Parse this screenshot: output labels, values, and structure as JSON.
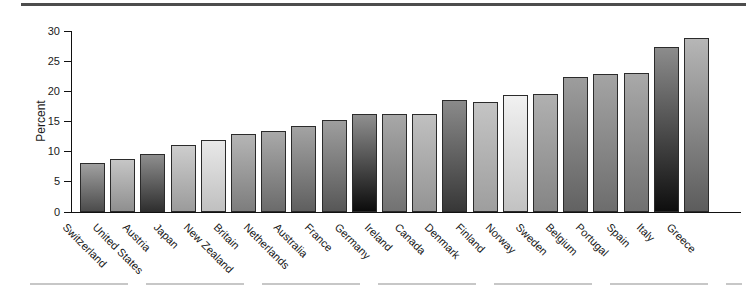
{
  "figure": {
    "ylabel": "Percent",
    "top_rule_color": "#4d4d4d",
    "bottom_rule_color": "#c7c7c7",
    "axis_color": "#111111",
    "bar_border_color": "#2b2b2b",
    "background": "#ffffff"
  },
  "chart_data": {
    "type": "bar",
    "title": "",
    "xlabel": "",
    "ylabel": "Percent",
    "ylim": [
      0,
      30
    ],
    "yticks": [
      0,
      5,
      10,
      15,
      20,
      25,
      30
    ],
    "grid": false,
    "legend": "none",
    "categories": [
      "Switzerland",
      "United States",
      "Austria",
      "Japan",
      "New Zealand",
      "Britain",
      "Netherlands",
      "Australia",
      "France",
      "Germany",
      "Ireland",
      "Canada",
      "Denmark",
      "Finland",
      "Norway",
      "Sweden",
      "Belgium",
      "Portugal",
      "Spain",
      "Italy",
      "Greece"
    ],
    "values": [
      8.2,
      8.8,
      9.6,
      11.1,
      11.9,
      13.0,
      13.4,
      14.2,
      15.2,
      16.2,
      16.2,
      16.3,
      18.5,
      18.3,
      19.4,
      19.5,
      22.4,
      22.9,
      23.1,
      27.3,
      28.9
    ],
    "bar_gradients": [
      {
        "top": "#a0a0a0",
        "bottom": "#4c4c4c"
      },
      {
        "top": "#c6c6c6",
        "bottom": "#8f8f8f"
      },
      {
        "top": "#8e8e8e",
        "bottom": "#2f2f2f"
      },
      {
        "top": "#cdcdcd",
        "bottom": "#9b9b9b"
      },
      {
        "top": "#e8e8e8",
        "bottom": "#c0c0c0"
      },
      {
        "top": "#b5b5b5",
        "bottom": "#7d7d7d"
      },
      {
        "top": "#a9a9a9",
        "bottom": "#6b6b6b"
      },
      {
        "top": "#a3a3a3",
        "bottom": "#5f5f5f"
      },
      {
        "top": "#9e9e9e",
        "bottom": "#575757"
      },
      {
        "top": "#8f8f8f",
        "bottom": "#0c0c0c"
      },
      {
        "top": "#a8a8a8",
        "bottom": "#727272"
      },
      {
        "top": "#c0c0c0",
        "bottom": "#949494"
      },
      {
        "top": "#8a8a8a",
        "bottom": "#373737"
      },
      {
        "top": "#c4c4c4",
        "bottom": "#9e9e9e"
      },
      {
        "top": "#f1f1f1",
        "bottom": "#c2c2c2"
      },
      {
        "top": "#b0b0b0",
        "bottom": "#858585"
      },
      {
        "top": "#9d9d9d",
        "bottom": "#626262"
      },
      {
        "top": "#a4a4a4",
        "bottom": "#6d6d6d"
      },
      {
        "top": "#a9a9a9",
        "bottom": "#707070"
      },
      {
        "top": "#8c8c8c",
        "bottom": "#0e0e0e"
      },
      {
        "top": "#b6b6b6",
        "bottom": "#5c5c5c"
      }
    ]
  }
}
